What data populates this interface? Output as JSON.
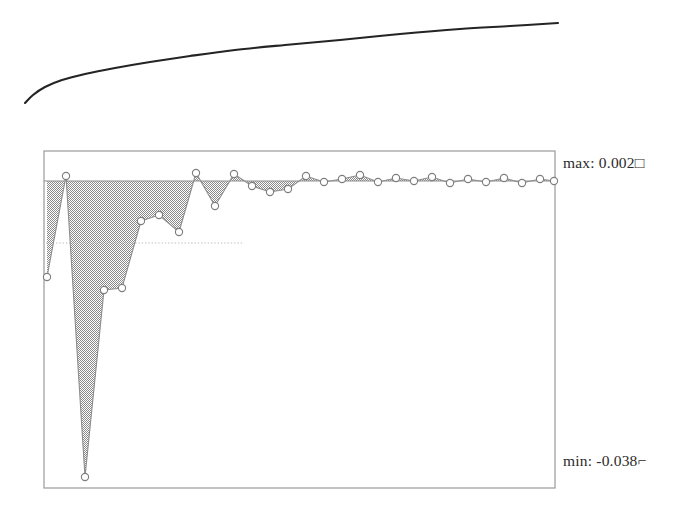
{
  "figure": {
    "background_color": "#ffffff",
    "ink_color": "#242424",
    "fill_color": "#8d8d8d",
    "frame_color": "#9a9a9a"
  },
  "annotations": {
    "max_label": "max: 0.002□",
    "min_label": "min: -0.038⌐"
  },
  "chart_data": [
    {
      "type": "line",
      "title": "",
      "xlabel": "",
      "ylabel": "",
      "grid": false,
      "legend": "none",
      "panel": "upper-curve",
      "description": "Smooth monotonic increasing curve, concave down",
      "xlim": [
        0,
        692
      ],
      "ylim": [
        0,
        130
      ],
      "x": [
        25,
        33,
        45,
        62,
        85,
        115,
        150,
        190,
        235,
        285,
        340,
        400,
        460,
        510,
        558
      ],
      "y": [
        103,
        95,
        87,
        80,
        74,
        68,
        62,
        56,
        50,
        45,
        40,
        34,
        29,
        26,
        23
      ]
    },
    {
      "type": "area",
      "title": "",
      "xlabel": "",
      "ylabel": "",
      "grid": false,
      "legend": "none",
      "panel": "lower-residuals",
      "description": "Residual / error area chart with open circle markers, dithered gray fill below a zero baseline",
      "frame": {
        "x": 44,
        "y": 151,
        "width": 511,
        "height": 337
      },
      "baseline_y": 181,
      "guide_line_y": 243,
      "ylim": [
        -0.038,
        0.002
      ],
      "max_value": 0.002,
      "min_value": -0.038,
      "x": [
        47,
        66,
        85,
        104,
        122,
        141,
        159,
        179,
        196,
        215,
        234,
        252,
        270,
        288,
        306,
        324,
        342,
        360,
        378,
        396,
        414,
        432,
        450,
        468,
        486,
        504,
        522,
        540,
        554
      ],
      "y": [
        277,
        176,
        477,
        290,
        288,
        221,
        215,
        232,
        173,
        206,
        174,
        186,
        192,
        189,
        176,
        182,
        179,
        175,
        182,
        178,
        181,
        177,
        183,
        179,
        182,
        178,
        183,
        179,
        181
      ],
      "values": [
        -0.0114,
        0.0006,
        -0.038,
        -0.0128,
        -0.0126,
        -0.0046,
        -0.0039,
        -0.0059,
        0.0009,
        -0.0029,
        0.0008,
        -0.0006,
        -0.0012,
        -0.0009,
        0.0006,
        -0.0001,
        0.0002,
        0.0007,
        -0.0001,
        0.0004,
        0.0,
        0.0005,
        -0.0002,
        0.0002,
        -0.0001,
        0.0004,
        -0.0002,
        0.0002,
        0.0
      ],
      "marker_count": 29,
      "marker_style": "open-circle"
    }
  ]
}
